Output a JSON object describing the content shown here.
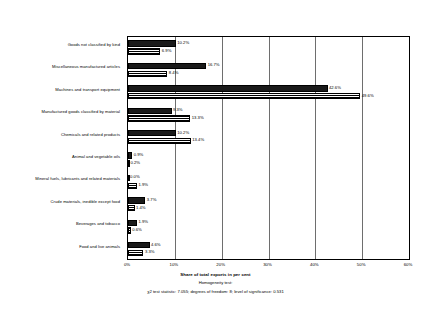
{
  "chart_data": {
    "type": "bar",
    "orientation": "horizontal",
    "title": "",
    "xlabel": "Share of total exports in per cent",
    "ylabel": "",
    "xlim": [
      0,
      60
    ],
    "xticks": [
      "0%",
      "10%",
      "20%",
      "30%",
      "40%",
      "50%",
      "60%"
    ],
    "xtick_values": [
      0,
      10,
      20,
      30,
      40,
      50,
      60
    ],
    "grid": true,
    "legend": "none",
    "categories": [
      "Goods not classified by kind",
      "Miscellaneous manufactured articles",
      "Machines and transport equipment",
      "Manufactured goods classified by material",
      "Chemicals and related products",
      "Animal and vegetable oils",
      "Mineral fuels, lubricants and related materials",
      "Crude materials, inedible except food",
      "Beverages and tobacco",
      "Food and live animals"
    ],
    "series": [
      {
        "name": "series-1",
        "pattern": "solid-dark",
        "values": [
          10.2,
          16.7,
          42.6,
          9.3,
          10.2,
          0.9,
          0.0,
          3.7,
          1.9,
          4.6
        ],
        "labels": [
          "10.2%",
          "16.7%",
          "42.6%",
          "9.3%",
          "10.2%",
          "0.9%",
          "0.0%",
          "3.7%",
          "1.9%",
          "4.6%"
        ]
      },
      {
        "name": "series-2",
        "pattern": "checkered",
        "values": [
          6.9,
          8.4,
          49.6,
          13.3,
          13.4,
          0.2,
          1.9,
          1.4,
          0.6,
          3.3
        ],
        "labels": [
          "6.9%",
          "8.4%",
          "49.6%",
          "13.3%",
          "13.4%",
          "0.2%",
          "1.9%",
          "1.4%",
          "0.6%",
          "3.3%"
        ]
      }
    ],
    "footnotes": {
      "line1": "Homogeneity test:",
      "line2": "χ2 test statistic: 7.055;   degrees of freedom: 8; level of significance: 0.531"
    }
  }
}
